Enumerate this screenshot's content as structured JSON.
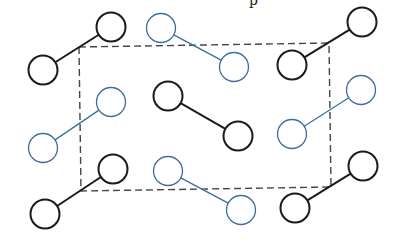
{
  "figure": {
    "partial_caption_glyph": "p",
    "colors": {
      "black_molecule": "#1a1a1a",
      "blue_molecule": "#3d6d9e",
      "unit_cell": "#444444",
      "background": "#ffffff"
    },
    "unit_cell": {
      "corners": [
        [
          79,
          47
        ],
        [
          329,
          43
        ],
        [
          331,
          187
        ],
        [
          81,
          191
        ]
      ],
      "style": "dashed"
    },
    "atom_radius": 14.5,
    "molecules": [
      {
        "id": "top-left",
        "color": "black",
        "a": [
          111,
          27
        ],
        "b": [
          43,
          70
        ]
      },
      {
        "id": "top-center",
        "color": "blue",
        "a": [
          161,
          28
        ],
        "b": [
          234,
          67
        ]
      },
      {
        "id": "top-right",
        "color": "black",
        "a": [
          362,
          22
        ],
        "b": [
          292,
          65
        ]
      },
      {
        "id": "mid-left",
        "color": "blue",
        "a": [
          111,
          102
        ],
        "b": [
          43,
          148
        ]
      },
      {
        "id": "center",
        "color": "black",
        "a": [
          168,
          96
        ],
        "b": [
          238,
          136
        ]
      },
      {
        "id": "mid-right",
        "color": "blue",
        "a": [
          361,
          90
        ],
        "b": [
          292,
          134
        ]
      },
      {
        "id": "bottom-left",
        "color": "black",
        "a": [
          113,
          169
        ],
        "b": [
          45,
          214
        ]
      },
      {
        "id": "bottom-center",
        "color": "blue",
        "a": [
          168,
          171
        ],
        "b": [
          241,
          210
        ]
      },
      {
        "id": "bottom-right",
        "color": "black",
        "a": [
          363,
          166
        ],
        "b": [
          295,
          208
        ]
      }
    ]
  }
}
